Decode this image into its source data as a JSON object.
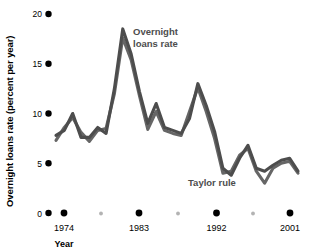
{
  "chart_data": {
    "type": "line",
    "title": "",
    "xlabel": "Year",
    "ylabel": "Overnight loans rate (percent per year)",
    "ylim": [
      0,
      20
    ],
    "xlim": [
      1972,
      2001
    ],
    "yticks": [
      0,
      5,
      10,
      15,
      20
    ],
    "ytick_labels": [
      "0",
      "5",
      "10",
      "15",
      "20"
    ],
    "xticks": [
      1974,
      1983,
      1992,
      2001
    ],
    "xtick_labels": [
      "1974",
      "1983",
      "1992",
      "2001"
    ],
    "xminor_ticks": [
      1977,
      1986,
      1995
    ],
    "grid": false,
    "legend_position": "inline-annotations",
    "x": [
      1972,
      1973,
      1974,
      1975,
      1976,
      1977,
      1978,
      1979,
      1980,
      1981,
      1982,
      1983,
      1984,
      1985,
      1986,
      1987,
      1988,
      1989,
      1990,
      1991,
      1992,
      1993,
      1994,
      1995,
      1996,
      1997,
      1998,
      1999,
      2000,
      2001
    ],
    "series": [
      {
        "name": "Overnight loans rate",
        "color": "#4d4d4d",
        "values": [
          7.8,
          8.3,
          10.0,
          7.6,
          7.6,
          8.6,
          8.0,
          12.5,
          18.5,
          16.0,
          12.2,
          9.0,
          11.0,
          8.6,
          8.3,
          8.0,
          9.5,
          13.0,
          10.8,
          8.2,
          4.5,
          3.8,
          5.5,
          6.8,
          4.5,
          4.2,
          4.8,
          5.3,
          5.5,
          4.2
        ]
      },
      {
        "name": "Taylor rule",
        "color": "#666666",
        "values": [
          7.3,
          8.6,
          9.6,
          8.1,
          7.2,
          8.3,
          8.5,
          12.0,
          17.6,
          15.4,
          11.8,
          8.4,
          10.2,
          8.3,
          8.0,
          7.8,
          10.2,
          12.6,
          10.2,
          7.5,
          4.0,
          4.2,
          5.8,
          6.5,
          4.2,
          3.0,
          4.5,
          5.0,
          5.2,
          4.0
        ]
      }
    ],
    "annotations": [
      {
        "label": "Overnight loans rate",
        "x": 1983,
        "y": 17.5
      },
      {
        "label": "Taylor rule",
        "x": 1993,
        "y": 2.2
      }
    ]
  },
  "axis": {
    "y_title": "Overnight loans rate (percent per year)",
    "x_title": "Year"
  },
  "annotation_overnight": {
    "line1": "Overnight",
    "line2": "loans rate"
  },
  "annotation_taylor": {
    "line1": "Taylor rule"
  },
  "colors": {
    "series_primary": "#4d4d4d",
    "series_secondary": "#666666",
    "tick_major": "#000000",
    "tick_minor": "#b3b3b3",
    "text": "#000000",
    "annotation": "#4d4d4d"
  }
}
